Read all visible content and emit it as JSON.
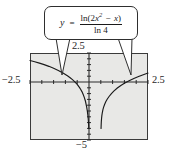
{
  "figure": {
    "kind": "graphing-calculator-plot",
    "background_color": "#ffffff",
    "plot_fill_color": "#e8e8e6",
    "frame_color": "#3a3a3a",
    "curve_color": "#1a1a1a"
  },
  "callout": {
    "y_symbol": "y",
    "equals": "=",
    "numerator": "ln(2x² − x)",
    "numerator_parts": {
      "ln_open": "ln(2",
      "var": "x",
      "exponent": "2",
      "minus": "−",
      "var2": "x",
      "close": ")"
    },
    "denominator": "ln 4",
    "full_expression": "y = ln(2x² − x) / ln 4"
  },
  "window": {
    "xmin_label": "−2.5",
    "xmax_label": "2.5",
    "ymax_label": "2.5",
    "ymin_label": "−5"
  },
  "chart_data": {
    "type": "line",
    "title": "",
    "subtitle": "",
    "xlabel": "",
    "ylabel": "",
    "xlim": [
      -2.5,
      2.5
    ],
    "ylim": [
      -5,
      2.5
    ],
    "grid": false,
    "legend": null,
    "annotations": [
      {
        "text": "y = ln(2x² − x) / ln 4",
        "type": "callout-box",
        "points_to": [
          "left-branch",
          "right-branch"
        ]
      }
    ],
    "axis_ticks": {
      "x_tick_step": 0.5,
      "y_tick_step": 0.5,
      "x_axis_at_y": 0,
      "y_axis_at_x": 0
    },
    "asymptotes": [
      {
        "type": "vertical",
        "x": 0
      },
      {
        "type": "vertical",
        "x": 0.5
      }
    ],
    "series": [
      {
        "name": "left-branch",
        "domain": [
          -2.5,
          0
        ],
        "points": [
          [
            -2.5,
            1.85
          ],
          [
            -2.3,
            1.75
          ],
          [
            -2.1,
            1.63
          ],
          [
            -1.9,
            1.5
          ],
          [
            -1.7,
            1.35
          ],
          [
            -1.5,
            1.19
          ],
          [
            -1.3,
            1.0
          ],
          [
            -1.1,
            0.78
          ],
          [
            -0.9,
            0.52
          ],
          [
            -0.8,
            0.37
          ],
          [
            -0.7,
            0.2
          ],
          [
            -0.6,
            0.01
          ],
          [
            -0.5,
            -0.21
          ],
          [
            -0.4,
            -0.48
          ],
          [
            -0.35,
            -0.64
          ],
          [
            -0.3,
            -0.83
          ],
          [
            -0.25,
            -1.05
          ],
          [
            -0.2,
            -1.32
          ],
          [
            -0.15,
            -1.66
          ],
          [
            -0.1,
            -2.14
          ],
          [
            -0.07,
            -2.51
          ],
          [
            -0.05,
            -2.83
          ],
          [
            -0.035,
            -3.12
          ],
          [
            -0.025,
            -3.37
          ],
          [
            -0.018,
            -3.6
          ],
          [
            -0.013,
            -3.83
          ],
          [
            -0.01,
            -4.0
          ]
        ]
      },
      {
        "name": "right-branch",
        "domain": [
          0.5,
          2.5
        ],
        "points": [
          [
            0.51,
            -4.0
          ],
          [
            0.513,
            -3.83
          ],
          [
            0.517,
            -3.62
          ],
          [
            0.523,
            -3.39
          ],
          [
            0.532,
            -3.15
          ],
          [
            0.545,
            -2.9
          ],
          [
            0.565,
            -2.63
          ],
          [
            0.59,
            -2.39
          ],
          [
            0.62,
            -2.17
          ],
          [
            0.66,
            -1.94
          ],
          [
            0.71,
            -1.71
          ],
          [
            0.77,
            -1.49
          ],
          [
            0.85,
            -1.25
          ],
          [
            0.95,
            -1.0
          ],
          [
            1.05,
            -0.79
          ],
          [
            1.2,
            -0.52
          ],
          [
            1.35,
            -0.3
          ],
          [
            1.5,
            -0.11
          ],
          [
            1.7,
            0.11
          ],
          [
            1.9,
            0.31
          ],
          [
            2.1,
            0.48
          ],
          [
            2.3,
            0.63
          ],
          [
            2.5,
            0.77
          ]
        ]
      }
    ]
  }
}
